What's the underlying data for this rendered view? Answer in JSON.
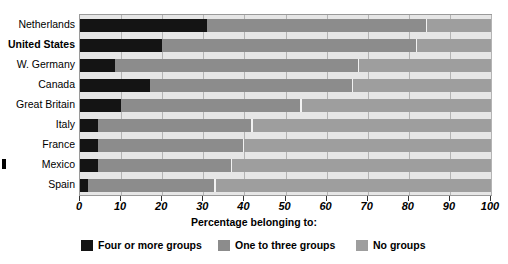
{
  "chart_data": {
    "type": "bar",
    "orientation": "horizontal",
    "stacked": true,
    "title": "",
    "xlabel": "Percentage belonging to:",
    "ylabel": "",
    "xlim": [
      0,
      100
    ],
    "grid": true,
    "legend_position": "bottom",
    "categories": [
      "Netherlands",
      "United States",
      "W. Germany",
      "Canada",
      "Great Britain",
      "Italy",
      "France",
      "Mexico",
      "Spain"
    ],
    "highlighted_category": "United States",
    "series": [
      {
        "name": "Four or more groups",
        "color": "#141414",
        "values": [
          31,
          20,
          8.5,
          17,
          10,
          4.5,
          4.5,
          4.5,
          2
        ]
      },
      {
        "name": "One to three groups",
        "color": "#8c8c8c",
        "values": [
          53.5,
          62,
          59.5,
          49.5,
          44,
          37.5,
          35.5,
          32.5,
          31
        ]
      },
      {
        "name": "No groups",
        "color": "#9e9e9e",
        "values": [
          15.5,
          18,
          32,
          33.5,
          46,
          58,
          60,
          63,
          67
        ]
      }
    ],
    "xticks": [
      0,
      10,
      20,
      30,
      40,
      50,
      60,
      70,
      80,
      90,
      100
    ],
    "xtick_labels": [
      "0",
      "10",
      "20",
      "30",
      "40",
      "50",
      "60",
      "70",
      "80",
      "90",
      "100"
    ]
  },
  "legend": {
    "items": [
      {
        "label": "Four or more groups",
        "swatch": "k0"
      },
      {
        "label": "One to three groups",
        "swatch": "k1"
      },
      {
        "label": "No groups",
        "swatch": "k2"
      }
    ]
  }
}
